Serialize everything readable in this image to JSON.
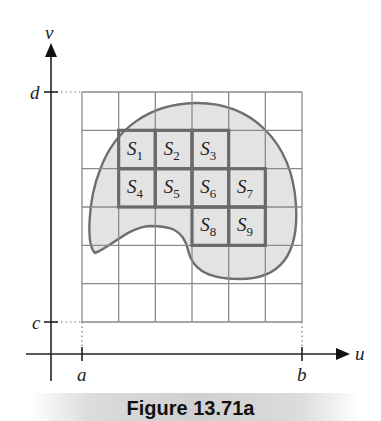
{
  "figure": {
    "caption": "Figure 13.71a",
    "axes": {
      "horizontal_label": "u",
      "vertical_label": "v",
      "tick_labels": {
        "a": "a",
        "b": "b",
        "c": "c",
        "d": "d"
      }
    },
    "grid": {
      "columns": 6,
      "rows": 6
    },
    "region": {
      "fill_color": "#e3e3e3",
      "outline_color": "#6e6e6e"
    },
    "subrectangles": [
      {
        "name": "S",
        "index": "1",
        "col": 1,
        "row": 1
      },
      {
        "name": "S",
        "index": "2",
        "col": 2,
        "row": 1
      },
      {
        "name": "S",
        "index": "3",
        "col": 3,
        "row": 1
      },
      {
        "name": "S",
        "index": "4",
        "col": 1,
        "row": 2
      },
      {
        "name": "S",
        "index": "5",
        "col": 2,
        "row": 2
      },
      {
        "name": "S",
        "index": "6",
        "col": 3,
        "row": 2
      },
      {
        "name": "S",
        "index": "7",
        "col": 4,
        "row": 2
      },
      {
        "name": "S",
        "index": "8",
        "col": 3,
        "row": 3
      },
      {
        "name": "S",
        "index": "9",
        "col": 4,
        "row": 3
      }
    ],
    "colors": {
      "grid": "#8a8a8a",
      "subrect_border": "#6a6a6a",
      "axis": "#222222"
    }
  }
}
